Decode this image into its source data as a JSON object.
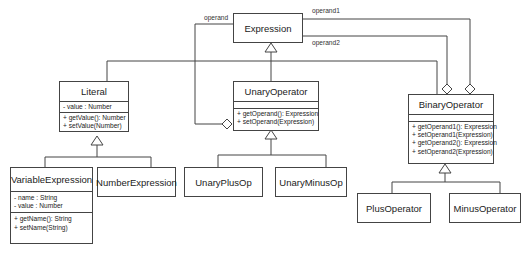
{
  "diagram": {
    "type": "UML class diagram",
    "classes": {
      "expression": {
        "name": "Expression",
        "attributes": [],
        "methods": []
      },
      "literal": {
        "name": "Literal",
        "attributes": [
          "- value : Number"
        ],
        "methods": [
          "+ getValue(): Number",
          "+ setValue(Number)"
        ]
      },
      "unary_operator": {
        "name": "UnaryOperator",
        "attributes": [],
        "methods": [
          "+ getOperand(): Expression",
          "+ setOperand(Expression)"
        ]
      },
      "binary_operator": {
        "name": "BinaryOperator",
        "attributes": [],
        "methods": [
          "+ getOperand1(): Expression",
          "+ setOperand1(Expression)",
          "+ getOperand2(): Expression",
          "+ setOperand2(Expression)"
        ]
      },
      "variable_expression": {
        "name": "VariableExpression",
        "attributes": [
          "- name : String",
          "- value : Number"
        ],
        "methods": [
          "+ getName(): String",
          "+ setName(String)"
        ]
      },
      "number_expression": {
        "name": "NumberExpression"
      },
      "unary_plus_op": {
        "name": "UnaryPlusOp"
      },
      "unary_minus_op": {
        "name": "UnaryMinusOp"
      },
      "plus_operator": {
        "name": "PlusOperator"
      },
      "minus_operator": {
        "name": "MinusOperator"
      }
    },
    "relationships": {
      "operand_label": "operand",
      "operand1_label": "operand1",
      "operand2_label": "operand2"
    }
  }
}
